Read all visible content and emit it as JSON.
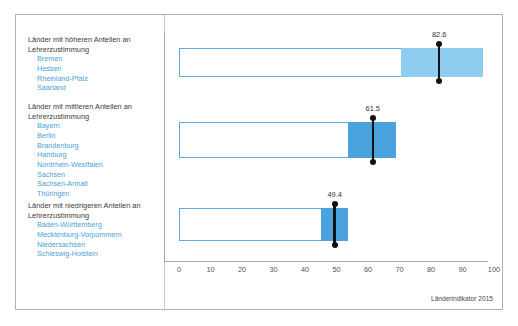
{
  "chart_data": {
    "type": "bar",
    "title": "",
    "subtitle": "",
    "xlabel": "",
    "ylabel": "",
    "xlim": [
      0,
      100
    ],
    "xticks": [
      0,
      10,
      20,
      30,
      40,
      50,
      60,
      70,
      80,
      90,
      100
    ],
    "xtick_labels": [
      "0",
      "10",
      "20",
      "30",
      "40",
      "50",
      "60",
      "70",
      "80",
      "90",
      "100"
    ],
    "grid": false,
    "legend_position": "left-outside",
    "orientation": "horizontal",
    "series": [
      {
        "name": "Länder mit höheren Anteilen an Lehrerzustimmung",
        "range_start": 0,
        "range_end": 96.5,
        "band_start": 70.5,
        "band_end": 96.5,
        "marker_value": 82.6,
        "marker_label": "82.6",
        "fill_color": "#8ecdf0",
        "outline_color": "#5badde",
        "members": [
          "Bremen",
          "Hessen",
          "Rheinland-Pfalz",
          "Saarland"
        ]
      },
      {
        "name": "Länder mit mittleren Anteilen an Lehrerzustimmung",
        "range_start": 0,
        "range_end": 68.9,
        "band_start": 53.7,
        "band_end": 68.9,
        "marker_value": 61.5,
        "marker_label": "61.5",
        "fill_color": "#4ba3dd",
        "outline_color": "#5badde",
        "members": [
          "Bayern",
          "Berlin",
          "Brandenburg",
          "Hamburg",
          "Nordrhein-Westfalen",
          "Sachsen",
          "Sachsen-Anhalt",
          "Thüringen"
        ]
      },
      {
        "name": "Länder mit niedrigeren Anteilen an Lehrerzustimmung",
        "range_start": 0,
        "range_end": 53.7,
        "band_start": 45.0,
        "band_end": 53.7,
        "marker_value": 49.4,
        "marker_label": "49.4",
        "fill_color": "#4ba3dd",
        "outline_color": "#5badde",
        "members": [
          "Baden-Württemberg",
          "Mecklenburg-Vorpommern",
          "Niedersachsen",
          "Schleswig-Holstein"
        ]
      }
    ],
    "annotations": [
      "82.6",
      "61.5",
      "49.4"
    ],
    "source_note": "Länderindikator 2015"
  },
  "groups": [
    {
      "title_line1": "Länder mit höheren Anteilen an",
      "title_line2": "Lehrerzustimmung",
      "states": [
        "Bremen",
        "Hessen",
        "Rheinland-Pfalz",
        "Saarland"
      ]
    },
    {
      "title_line1": "Länder mit mittleren Anteilen an",
      "title_line2": "Lehrerzustimmung",
      "states": [
        "Bayern",
        "Berlin",
        "Brandenburg",
        "Hamburg",
        "Nordrhein-Westfalen",
        "Sachsen",
        "Sachsen-Anhalt",
        "Thüringen"
      ]
    },
    {
      "title_line1": "Länder mit niedrigeren Anteilen an",
      "title_line2": "Lehrerzustimmung",
      "states": [
        "Baden-Württemberg",
        "Mecklenburg-Vorpommern",
        "Niedersachsen",
        "Schleswig-Holstein"
      ]
    }
  ],
  "axis": {
    "tick_labels": [
      "0",
      "10",
      "20",
      "30",
      "40",
      "50",
      "60",
      "70",
      "80",
      "90",
      "100"
    ]
  },
  "source": {
    "text": "Länderindikator 2015"
  },
  "colors": {
    "band_light": "#8ecdf0",
    "band_dark": "#4ba3dd",
    "outline": "#5badde",
    "marker": "#111111",
    "state_text": "#4a9fd4",
    "title_text": "#3a3a3a",
    "frame": "#b0b0b0"
  }
}
